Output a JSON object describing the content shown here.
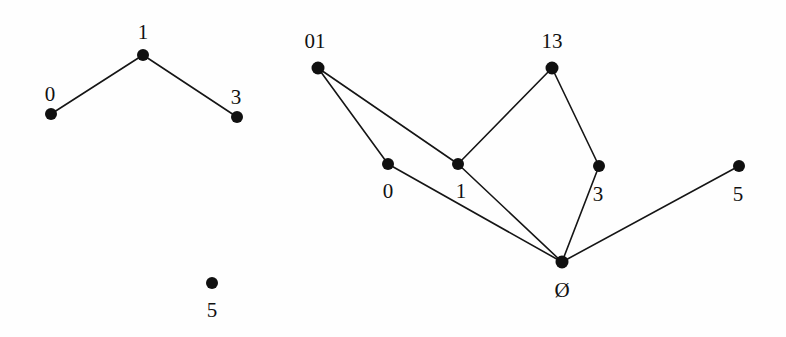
{
  "figure": {
    "background_color": "#fefefe",
    "ink_color": "#111111",
    "width": 786,
    "height": 337
  },
  "panels": [
    {
      "name": "left-hasse-diagram",
      "caption": "",
      "nodes": [
        {
          "id": "L1",
          "label": "1",
          "x": 143,
          "y": 55,
          "r": 6.0,
          "label_x": 143,
          "label_y": 32
        },
        {
          "id": "L0",
          "label": "0",
          "x": 51,
          "y": 114,
          "r": 6.0,
          "label_x": 50,
          "label_y": 94
        },
        {
          "id": "L3",
          "label": "3",
          "x": 237,
          "y": 117,
          "r": 6.0,
          "label_x": 236,
          "label_y": 97
        },
        {
          "id": "L5",
          "label": "5",
          "x": 212,
          "y": 283,
          "r": 6.0,
          "label_x": 212,
          "label_y": 310
        }
      ],
      "edges": [
        {
          "from": "L0",
          "to": "L1"
        },
        {
          "from": "L1",
          "to": "L3"
        }
      ]
    },
    {
      "name": "right-hasse-diagram",
      "caption": "",
      "nodes": [
        {
          "id": "R01",
          "label": "01",
          "x": 318,
          "y": 68,
          "r": 6.5,
          "label_x": 315,
          "label_y": 41
        },
        {
          "id": "R13",
          "label": "13",
          "x": 552,
          "y": 68,
          "r": 6.5,
          "label_x": 552,
          "label_y": 41
        },
        {
          "id": "R0",
          "label": "0",
          "x": 388,
          "y": 164,
          "r": 6.0,
          "label_x": 388,
          "label_y": 191
        },
        {
          "id": "R1",
          "label": "1",
          "x": 458,
          "y": 164,
          "r": 6.0,
          "label_x": 461,
          "label_y": 191
        },
        {
          "id": "R3",
          "label": "3",
          "x": 599,
          "y": 166,
          "r": 6.0,
          "label_x": 598,
          "label_y": 194
        },
        {
          "id": "R5",
          "label": "5",
          "x": 739,
          "y": 166,
          "r": 6.0,
          "label_x": 738,
          "label_y": 194
        },
        {
          "id": "RE",
          "label": "Ø",
          "x": 562,
          "y": 262,
          "r": 6.5,
          "label_x": 562,
          "label_y": 290
        }
      ],
      "edges": [
        {
          "from": "R01",
          "to": "R0"
        },
        {
          "from": "R01",
          "to": "R1"
        },
        {
          "from": "R0",
          "to": "RE"
        },
        {
          "from": "R1",
          "to": "R13"
        },
        {
          "from": "R1",
          "to": "RE"
        },
        {
          "from": "R13",
          "to": "R3"
        },
        {
          "from": "R3",
          "to": "RE"
        },
        {
          "from": "RE",
          "to": "R5"
        }
      ]
    }
  ]
}
